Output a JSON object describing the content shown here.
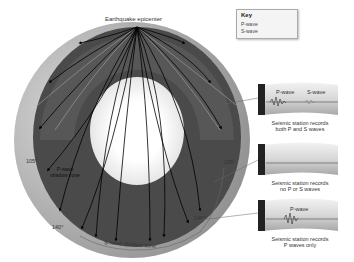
{
  "title": "Earthquake epicenter",
  "key": {
    "title": "Key",
    "items": [
      {
        "label": "P-wave",
        "style": "black arrow"
      },
      {
        "label": "S-wave",
        "style": "gray line"
      }
    ]
  },
  "earth": {
    "angle_labels": {
      "left_105": "105°",
      "right_105": "105°",
      "left_140": "140°",
      "right_140": "140°"
    },
    "p_wave_shadow_zone": "P-wave shadow zone",
    "s_wave_shadow_zone": "S-wave shadow zone"
  },
  "stations": [
    {
      "wave_labels": [
        "P-wave",
        "S-wave"
      ],
      "caption_line1": "Seismic station records",
      "caption_line2": "both P and S waves"
    },
    {
      "wave_labels": [],
      "caption_line1": "Seismic station records",
      "caption_line2": "no P or S waves"
    },
    {
      "wave_labels": [
        "P-wave"
      ],
      "caption_line1": "Seismic station records",
      "caption_line2": "P waves only"
    }
  ],
  "colors": {
    "mantle": "#4a4a4a",
    "mantle_light": "#6a6a6a",
    "outer_core": "#e8e8e8",
    "inner_core": "#ffffff",
    "crust_land": "#bdbdbd",
    "p_wave": "#000000",
    "s_wave": "#9a9a9a"
  }
}
